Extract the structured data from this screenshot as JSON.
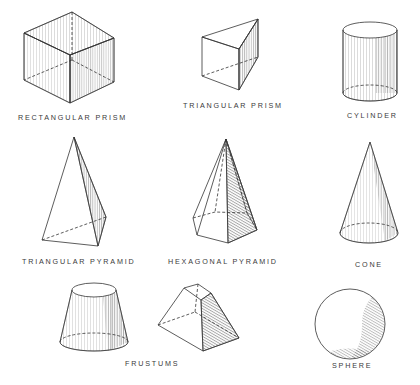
{
  "diagram": {
    "title": "",
    "background": "#ffffff",
    "line_color": "#3a3a3a",
    "shapes": [
      {
        "id": "rectangular-prism",
        "label": "RECTANGULAR PRISM"
      },
      {
        "id": "triangular-prism",
        "label": "TRIANGULAR PRISM"
      },
      {
        "id": "cylinder",
        "label": "CYLINDER"
      },
      {
        "id": "triangular-pyramid",
        "label": "TRIANGULAR PYRAMID"
      },
      {
        "id": "hexagonal-pyramid",
        "label": "HEXAGONAL PYRAMID"
      },
      {
        "id": "cone",
        "label": "CONE"
      },
      {
        "id": "frustums",
        "label": "FRUSTUMS"
      },
      {
        "id": "sphere",
        "label": "SPHERE"
      }
    ]
  }
}
